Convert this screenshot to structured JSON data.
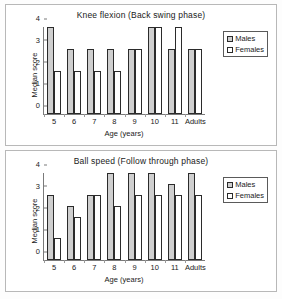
{
  "charts": [
    {
      "title": "Knee flexion (Back swing phase)",
      "xlabel": "Age (years)",
      "ylabel": "Median score",
      "yticks": [
        "4",
        "3",
        "2",
        "1",
        "0"
      ],
      "legend": {
        "males": "Males",
        "females": "Females"
      }
    },
    {
      "title": "Ball speed (Follow through phase)",
      "xlabel": "Age (years)",
      "ylabel": "Median score",
      "yticks": [
        "4",
        "3",
        "2",
        "1",
        "0"
      ],
      "legend": {
        "males": "Males",
        "females": "Females"
      }
    }
  ],
  "colors": {
    "males_fill": "#cfcfcf",
    "females_fill": "#ffffff",
    "bar_stroke": "#2b2b2b",
    "axis": "#7a7a7a",
    "panel_border": "#b8b8b8",
    "text": "#1a1a1a"
  },
  "chart_data": [
    {
      "type": "bar",
      "title": "Knee flexion (Back swing phase)",
      "xlabel": "Age (years)",
      "ylabel": "Median score",
      "ylim": [
        0,
        4
      ],
      "yticks": [
        0,
        1,
        2,
        3,
        4
      ],
      "grid": false,
      "legend_position": "right",
      "categories": [
        "5",
        "6",
        "7",
        "8",
        "9",
        "10",
        "11",
        "Adults"
      ],
      "series": [
        {
          "name": "Males",
          "values": [
            4,
            3,
            3,
            3,
            3,
            4,
            3,
            3
          ]
        },
        {
          "name": "Females",
          "values": [
            2,
            2,
            2,
            2,
            3,
            4,
            4,
            3
          ]
        }
      ]
    },
    {
      "type": "bar",
      "title": "Ball speed (Follow through phase)",
      "xlabel": "Age (years)",
      "ylabel": "Median score",
      "ylim": [
        0,
        4
      ],
      "yticks": [
        0,
        1,
        2,
        3,
        4
      ],
      "grid": false,
      "legend_position": "right",
      "categories": [
        "5",
        "6",
        "7",
        "8",
        "9",
        "10",
        "11",
        "Adults"
      ],
      "series": [
        {
          "name": "Males",
          "values": [
            3,
            2.5,
            3,
            4,
            4,
            4,
            3.5,
            4
          ]
        },
        {
          "name": "Females",
          "values": [
            1,
            2,
            3,
            2.5,
            3,
            3,
            3,
            3
          ]
        }
      ]
    }
  ]
}
